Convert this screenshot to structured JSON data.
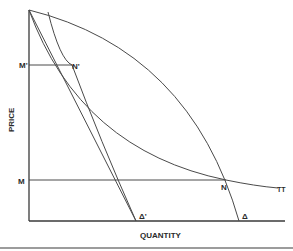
{
  "diagram": {
    "axes": {
      "x_label": "QUANTITY",
      "y_label": "PRICE"
    },
    "points": {
      "m_prime": "M'",
      "n_prime": "N'",
      "m": "M",
      "n": "N",
      "delta_prime": "Δ'",
      "delta": "Δ",
      "tt": "TT"
    },
    "colors": {
      "line": "#4a4a4a",
      "axis": "#3a3a3a",
      "text": "#2a2a2a"
    }
  }
}
